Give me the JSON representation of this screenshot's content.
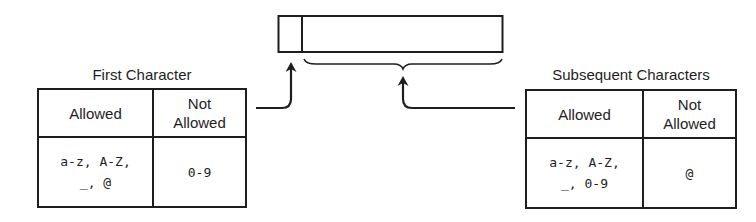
{
  "diagram": {
    "identifier_box": {
      "segments": [
        "first-character",
        "subsequent-characters"
      ]
    },
    "first_character": {
      "title": "First Character",
      "headers": {
        "allowed": "Allowed",
        "not_allowed": "Not Allowed"
      },
      "allowed": {
        "line1": "a-z, A-Z,",
        "line2": "_, @"
      },
      "not_allowed": "0-9"
    },
    "subsequent_characters": {
      "title": "Subsequent Characters",
      "headers": {
        "allowed": "Allowed",
        "not_allowed": "Not Allowed"
      },
      "allowed": {
        "line1": "a-z, A-Z,",
        "line2": "_, 0-9"
      },
      "not_allowed": "@"
    },
    "colors": {
      "stroke": "#1e1e1e",
      "background": "#ffffff"
    }
  }
}
